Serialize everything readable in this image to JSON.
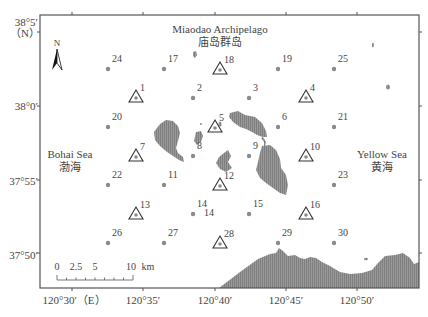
{
  "map": {
    "title_en": "Miaodao Archipelago",
    "title_cn": "庙岛群岛",
    "seas": [
      {
        "name_en": "Bohai Sea",
        "name_cn": "渤海",
        "x": 68,
        "y": 156
      },
      {
        "name_en": "Yellow Sea",
        "name_cn": "黄海",
        "x": 383,
        "y": 156
      }
    ],
    "north_arrow": {
      "label": "N"
    },
    "frame": {
      "left": 40,
      "top": 15,
      "right": 419,
      "bottom": 288
    },
    "lat_labels": [
      {
        "text": "38°5′",
        "y": 26
      },
      {
        "text": "（N）",
        "y": 37
      },
      {
        "text": "38°0′",
        "y": 107
      },
      {
        "text": "37°55′",
        "y": 182
      },
      {
        "text": "37°50′",
        "y": 257
      }
    ],
    "lon_labels": [
      {
        "text": "120°30′（E）",
        "x": 68
      },
      {
        "text": "120°35′",
        "x": 143
      },
      {
        "text": "120°40′",
        "x": 215
      },
      {
        "text": "120°45′",
        "x": 285
      },
      {
        "text": "120°50′",
        "x": 357
      }
    ],
    "scale_bar": {
      "labels": [
        {
          "text": "0",
          "x": 57
        },
        {
          "text": "2.5",
          "x": 75
        },
        {
          "text": "5",
          "x": 95
        },
        {
          "text": "10",
          "x": 130
        },
        {
          "text": "km",
          "x": 145
        }
      ]
    },
    "legend_note": "triangle = sampling station with extra measurement; dot = station",
    "stations": [
      {
        "id": "1",
        "x": 136,
        "y": 97,
        "type": "triangle"
      },
      {
        "id": "2",
        "x": 193,
        "y": 98,
        "type": "dot"
      },
      {
        "id": "3",
        "x": 249,
        "y": 98,
        "type": "dot"
      },
      {
        "id": "4",
        "x": 306,
        "y": 97,
        "type": "triangle"
      },
      {
        "id": "5",
        "x": 215,
        "y": 127,
        "type": "triangle"
      },
      {
        "id": "6",
        "x": 278,
        "y": 127,
        "type": "dot"
      },
      {
        "id": "7",
        "x": 136,
        "y": 156,
        "type": "triangle"
      },
      {
        "id": "8",
        "x": 193,
        "y": 156,
        "type": "dot"
      },
      {
        "id": "9",
        "x": 249,
        "y": 156,
        "type": "dot"
      },
      {
        "id": "10",
        "x": 306,
        "y": 156,
        "type": "triangle"
      },
      {
        "id": "11",
        "x": 164,
        "y": 185,
        "type": "dot"
      },
      {
        "id": "12",
        "x": 220,
        "y": 185,
        "type": "triangle"
      },
      {
        "id": "13",
        "x": 136,
        "y": 214,
        "type": "triangle"
      },
      {
        "id": "14",
        "x": 193,
        "y": 214,
        "type": "dot"
      },
      {
        "id": "15",
        "x": 249,
        "y": 214,
        "type": "dot"
      },
      {
        "id": "16",
        "x": 306,
        "y": 214,
        "type": "triangle"
      },
      {
        "id": "17",
        "x": 164,
        "y": 69,
        "type": "dot"
      },
      {
        "id": "18",
        "x": 220,
        "y": 69,
        "type": "triangle"
      },
      {
        "id": "19",
        "x": 278,
        "y": 69,
        "type": "dot"
      },
      {
        "id": "20",
        "x": 108,
        "y": 127,
        "type": "dot"
      },
      {
        "id": "21",
        "x": 334,
        "y": 127,
        "type": "dot"
      },
      {
        "id": "22",
        "x": 108,
        "y": 185,
        "type": "dot"
      },
      {
        "id": "23",
        "x": 334,
        "y": 185,
        "type": "dot"
      },
      {
        "id": "24",
        "x": 108,
        "y": 69,
        "type": "dot"
      },
      {
        "id": "25",
        "x": 334,
        "y": 69,
        "type": "dot"
      },
      {
        "id": "26",
        "x": 108,
        "y": 243,
        "type": "dot"
      },
      {
        "id": "27",
        "x": 164,
        "y": 243,
        "type": "dot"
      },
      {
        "id": "28",
        "x": 220,
        "y": 243,
        "type": "triangle"
      },
      {
        "id": "29",
        "x": 278,
        "y": 243,
        "type": "dot"
      },
      {
        "id": "30",
        "x": 334,
        "y": 243,
        "type": "dot"
      }
    ],
    "colors": {
      "land": "#8c8c8c",
      "station": "#8a8a8a",
      "frame": "#444444",
      "text": "#444444"
    }
  }
}
